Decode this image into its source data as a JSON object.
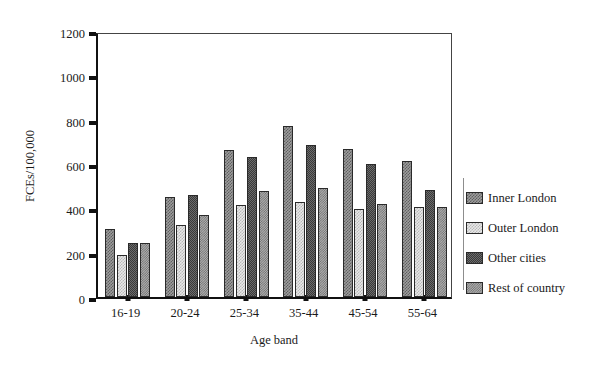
{
  "chart_data": {
    "type": "bar",
    "title": "",
    "subtitle": "",
    "xlabel": "Age band",
    "ylabel": "FCEs/100,000",
    "categories": [
      "16-19",
      "20-24",
      "25-34",
      "35-44",
      "45-54",
      "55-64"
    ],
    "series": [
      {
        "name": "Inner London",
        "values": [
          305,
          450,
          665,
          772,
          667,
          615
        ]
      },
      {
        "name": "Outer London",
        "values": [
          190,
          325,
          415,
          430,
          398,
          405
        ]
      },
      {
        "name": "Other cities",
        "values": [
          243,
          458,
          630,
          687,
          600,
          485
        ]
      },
      {
        "name": "Rest of country",
        "values": [
          245,
          372,
          478,
          492,
          418,
          405
        ]
      }
    ],
    "ylim": [
      0,
      1200
    ],
    "yticks": [
      0,
      200,
      400,
      600,
      800,
      1000,
      1200
    ],
    "ytick_labels": [
      "0",
      "200",
      "400",
      "600",
      "800",
      "1000",
      "1200"
    ],
    "grid": false,
    "legend_position": "right",
    "colors": {
      "inner_london": "#9d9d9d",
      "outer_london": "#e8e8e8",
      "other_cities": "#6b6b6b",
      "rest_of_country": "#aeaeae",
      "axis": "#111111",
      "background": "#ffffff"
    }
  },
  "legend": {
    "items": [
      {
        "label": "Inner London",
        "swatch": "hatch-medium-checker"
      },
      {
        "label": "Outer London",
        "swatch": "hatch-light-sparse"
      },
      {
        "label": "Other cities",
        "swatch": "hatch-dark-dense"
      },
      {
        "label": "Rest of country",
        "swatch": "hatch-mid-dotted"
      }
    ]
  }
}
